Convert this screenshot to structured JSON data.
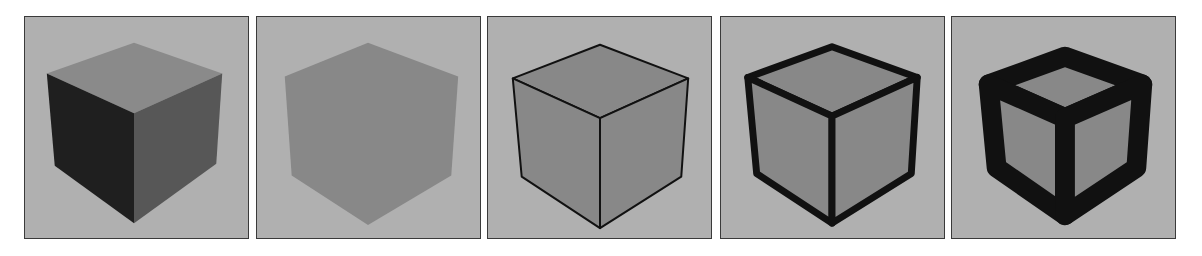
{
  "figure": {
    "colors": {
      "background": "#b0b0b0",
      "face_mid": "#888888",
      "face_top_shaded": "#8c8c8c",
      "face_left_shaded": "#202020",
      "face_right_shaded": "#585858",
      "outline": "#111111",
      "panel_border": "#3a3a3a"
    },
    "panels": [
      {
        "id": 1,
        "style": "shaded",
        "edge_width": 0
      },
      {
        "id": 2,
        "style": "flat-silhouette",
        "edge_width": 0
      },
      {
        "id": 3,
        "style": "flat-thin-outline",
        "edge_width": 2
      },
      {
        "id": 4,
        "style": "flat-medium-outline",
        "edge_width": 7
      },
      {
        "id": 5,
        "style": "flat-thick-outline",
        "edge_width": 20
      }
    ]
  }
}
